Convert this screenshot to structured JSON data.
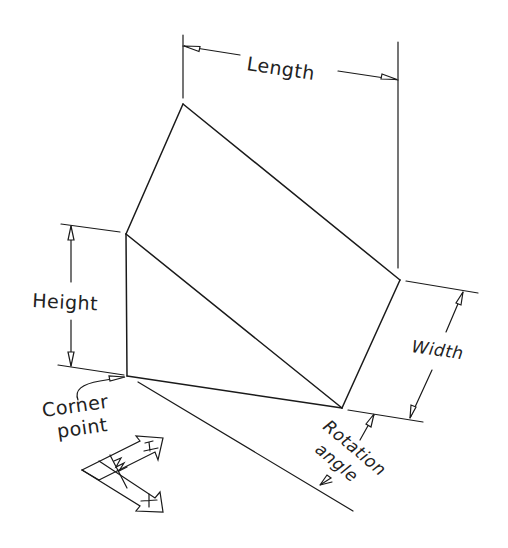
{
  "diagram": {
    "colors": {
      "line": "#1a1a1a",
      "text": "#222222",
      "background": "#ffffff"
    },
    "labels": {
      "length": "Length",
      "height": "Height",
      "width": "Width",
      "corner_point_line1": "Corner",
      "corner_point_line2": "point",
      "rotation_line1": "Rotation",
      "rotation_line2": "angle"
    },
    "ucs_icon": {
      "y_glyph": "Y",
      "w_glyph": "W",
      "x_glyph": "+"
    },
    "vertices": {
      "top": [
        183,
        104
      ],
      "upper_left": [
        126,
        234
      ],
      "corner_point": [
        127,
        376
      ],
      "right": [
        400,
        280
      ],
      "bottom_right": [
        342,
        408
      ]
    }
  }
}
